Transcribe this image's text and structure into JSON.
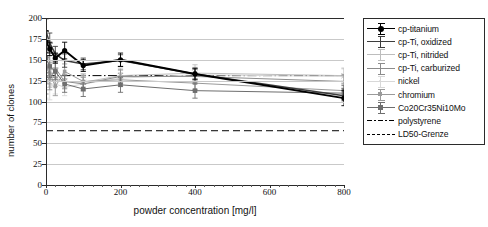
{
  "chart_data": {
    "type": "line",
    "title": "",
    "xlabel": "powder concentration [mg/l]",
    "ylabel": "number of clones",
    "xlim": [
      0,
      800
    ],
    "ylim": [
      0,
      200
    ],
    "xticks": [
      0,
      200,
      400,
      600,
      800
    ],
    "yticks": [
      0,
      25,
      50,
      75,
      100,
      125,
      150,
      175,
      200
    ],
    "grid": true,
    "legend_position": "right-outside",
    "x": [
      0,
      10,
      25,
      50,
      100,
      200,
      400,
      800
    ],
    "series": [
      {
        "name": "cp-titanium",
        "color": "#000000",
        "marker": "circle-filled",
        "values": [
          172,
          163,
          152,
          161,
          143,
          150,
          133,
          104
        ],
        "errors": [
          13,
          8,
          6,
          10,
          7,
          8,
          7,
          9
        ]
      },
      {
        "name": "cp-Ti, oxidized",
        "color": "#3d3d3d",
        "marker": "plus",
        "values": [
          184,
          170,
          157,
          149,
          145,
          149,
          133,
          107
        ],
        "errors": [
          15,
          12,
          9,
          8,
          7,
          7,
          6,
          8
        ]
      },
      {
        "name": "cp-Ti, nitrided",
        "color": "#bdbdbd",
        "marker": "cross",
        "values": [
          150,
          131,
          128,
          124,
          123,
          131,
          134,
          131
        ],
        "errors": [
          20,
          14,
          10,
          9,
          8,
          9,
          10,
          9
        ]
      },
      {
        "name": "cp-Ti, carburized",
        "color": "#8c8c8c",
        "marker": "dash",
        "values": [
          131,
          126,
          140,
          124,
          121,
          130,
          130,
          124
        ],
        "errors": [
          22,
          12,
          11,
          8,
          8,
          8,
          9,
          8
        ]
      },
      {
        "name": "nickel",
        "color": "#d8d8d8",
        "marker": "dot",
        "values": [
          128,
          118,
          121,
          117,
          121,
          128,
          132,
          130
        ],
        "errors": [
          24,
          16,
          12,
          10,
          9,
          9,
          9,
          9
        ]
      },
      {
        "name": "chromium",
        "color": "#9a9a9a",
        "marker": "square-small",
        "values": [
          140,
          134,
          118,
          136,
          124,
          126,
          122,
          113
        ],
        "errors": [
          18,
          13,
          11,
          9,
          9,
          8,
          8,
          8
        ]
      },
      {
        "name": "Co20Cr35Ni10Mo",
        "color": "#6e6e6e",
        "marker": "square-filled",
        "values": [
          152,
          142,
          136,
          121,
          115,
          120,
          113,
          110
        ],
        "errors": [
          17,
          13,
          10,
          10,
          9,
          9,
          9,
          9
        ]
      }
    ],
    "reference_lines": [
      {
        "name": "polystyrene",
        "value": 131,
        "style": "dash-dot",
        "color": "#000000"
      },
      {
        "name": "LD50-Grenze",
        "value": 65,
        "style": "dashed",
        "color": "#000000"
      }
    ]
  },
  "axes": {
    "ylabel": "number of clones",
    "xlabel": "powder concentration [mg/l]",
    "yticks": [
      "200",
      "175",
      "150",
      "125",
      "100",
      "75",
      "50",
      "25",
      "0"
    ],
    "xticks": [
      "0",
      "200",
      "400",
      "600",
      "800"
    ]
  },
  "legend": {
    "items": [
      {
        "label": "cp-titanium",
        "marker": "circle-filled",
        "color": "#000000"
      },
      {
        "label": "cp-Ti, oxidized",
        "marker": "plus",
        "color": "#3d3d3d"
      },
      {
        "label": "cp-Ti, nitrided",
        "marker": "cross",
        "color": "#bdbdbd"
      },
      {
        "label": "cp-Ti, carburized",
        "marker": "dash",
        "color": "#8c8c8c"
      },
      {
        "label": "nickel",
        "marker": "dot",
        "color": "#d8d8d8"
      },
      {
        "label": "chromium",
        "marker": "square-small",
        "color": "#9a9a9a"
      },
      {
        "label": "Co20Cr35Ni10Mo",
        "marker": "square-filled",
        "color": "#6e6e6e"
      },
      {
        "label": "polystyrene",
        "marker": "dash-dot-line",
        "color": "#000000"
      },
      {
        "label": "LD50-Grenze",
        "marker": "dashed-line",
        "color": "#000000"
      }
    ]
  }
}
